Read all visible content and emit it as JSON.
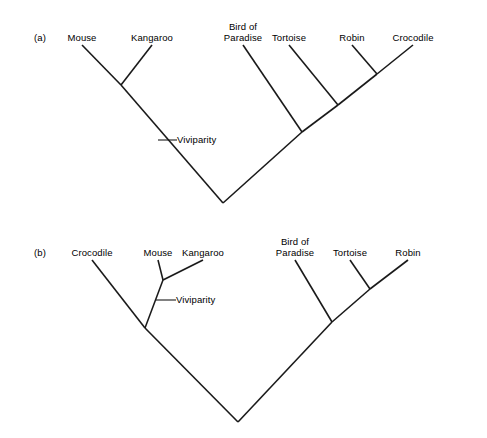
{
  "figure": {
    "width": 487,
    "height": 438,
    "background": "#ffffff",
    "line_color": "#1a1a1a",
    "text_color": "#000000"
  },
  "panels": [
    {
      "id": "a",
      "label": "(a)",
      "label_x": 34,
      "label_y": 33,
      "tips": [
        {
          "name": "mouse",
          "label": "Mouse",
          "x": 82,
          "y": 33,
          "line_x": 82,
          "line_y": 45
        },
        {
          "name": "kangaroo",
          "label": "Kangaroo",
          "x": 152,
          "y": 33,
          "line_x": 152,
          "line_y": 45
        },
        {
          "name": "bird-of-paradise",
          "label": "Bird of\nParadise",
          "x": 243,
          "y": 22,
          "line_x": 243,
          "line_y": 45
        },
        {
          "name": "tortoise",
          "label": "Tortoise",
          "x": 289,
          "y": 33,
          "line_x": 289,
          "line_y": 45
        },
        {
          "name": "robin",
          "label": "Robin",
          "x": 352,
          "y": 33,
          "line_x": 352,
          "line_y": 45
        },
        {
          "name": "crocodile",
          "label": "Crocodile",
          "x": 413,
          "y": 33,
          "line_x": 413,
          "line_y": 45
        }
      ],
      "nodes": [
        {
          "name": "mouse-kangaroo-node",
          "x": 121,
          "y": 85
        },
        {
          "name": "robin-crocodile-node",
          "x": 377,
          "y": 74
        },
        {
          "name": "tortoise-node",
          "x": 338,
          "y": 105
        },
        {
          "name": "bird-node",
          "x": 302,
          "y": 132
        },
        {
          "name": "root-node",
          "x": 223,
          "y": 203
        }
      ],
      "branches": [
        {
          "name": "branch-mouse",
          "x1": 82,
          "y1": 45,
          "x2": 121,
          "y2": 85
        },
        {
          "name": "branch-kangaroo",
          "x1": 152,
          "y1": 45,
          "x2": 121,
          "y2": 85
        },
        {
          "name": "branch-mammal-stem",
          "x1": 121,
          "y1": 85,
          "x2": 223,
          "y2": 203
        },
        {
          "name": "branch-crocodile",
          "x1": 413,
          "y1": 45,
          "x2": 377,
          "y2": 74
        },
        {
          "name": "branch-robin",
          "x1": 352,
          "y1": 45,
          "x2": 377,
          "y2": 74
        },
        {
          "name": "branch-robin-croc-stem",
          "x1": 377,
          "y1": 74,
          "x2": 338,
          "y2": 105
        },
        {
          "name": "branch-tortoise",
          "x1": 289,
          "y1": 45,
          "x2": 338,
          "y2": 105
        },
        {
          "name": "branch-tortoise-stem",
          "x1": 338,
          "y1": 105,
          "x2": 302,
          "y2": 132
        },
        {
          "name": "branch-bird",
          "x1": 243,
          "y1": 45,
          "x2": 302,
          "y2": 132
        },
        {
          "name": "branch-reptile-stem",
          "x1": 302,
          "y1": 132,
          "x2": 223,
          "y2": 203
        }
      ],
      "trait": {
        "name": "viviparity",
        "label": "Viviparity",
        "tick_x1": 158,
        "tick_y1": 140,
        "tick_x2": 177,
        "tick_y2": 140,
        "label_x": 177,
        "label_y": 135
      }
    },
    {
      "id": "b",
      "label": "(b)",
      "label_x": 34,
      "label_y": 248,
      "tips": [
        {
          "name": "crocodile",
          "label": "Crocodile",
          "x": 92,
          "y": 248,
          "line_x": 92,
          "line_y": 260
        },
        {
          "name": "mouse",
          "label": "Mouse",
          "x": 158,
          "y": 248,
          "line_x": 158,
          "line_y": 260
        },
        {
          "name": "kangaroo",
          "label": "Kangaroo",
          "x": 203,
          "y": 248,
          "line_x": 203,
          "line_y": 260
        },
        {
          "name": "bird-of-paradise",
          "label": "Bird of\nParadise",
          "x": 295,
          "y": 237,
          "line_x": 295,
          "line_y": 260
        },
        {
          "name": "tortoise",
          "label": "Tortoise",
          "x": 350,
          "y": 248,
          "line_x": 350,
          "line_y": 260
        },
        {
          "name": "robin",
          "label": "Robin",
          "x": 408,
          "y": 248,
          "line_x": 408,
          "line_y": 260
        }
      ],
      "nodes": [
        {
          "name": "mouse-kangaroo-node",
          "x": 163,
          "y": 280
        },
        {
          "name": "crocodile-node",
          "x": 145,
          "y": 328
        },
        {
          "name": "tortoise-robin-node",
          "x": 370,
          "y": 289
        },
        {
          "name": "bird-node",
          "x": 332,
          "y": 322
        },
        {
          "name": "root-node",
          "x": 238,
          "y": 422
        }
      ],
      "branches": [
        {
          "name": "branch-mouse",
          "x1": 158,
          "y1": 260,
          "x2": 163,
          "y2": 280
        },
        {
          "name": "branch-kangaroo",
          "x1": 203,
          "y1": 260,
          "x2": 163,
          "y2": 280
        },
        {
          "name": "branch-mouse-kang-stem",
          "x1": 163,
          "y1": 280,
          "x2": 145,
          "y2": 328
        },
        {
          "name": "branch-crocodile",
          "x1": 92,
          "y1": 260,
          "x2": 145,
          "y2": 328
        },
        {
          "name": "branch-croc-clade-stem",
          "x1": 145,
          "y1": 328,
          "x2": 238,
          "y2": 422
        },
        {
          "name": "branch-robin",
          "x1": 408,
          "y1": 260,
          "x2": 370,
          "y2": 289
        },
        {
          "name": "branch-tortoise",
          "x1": 350,
          "y1": 260,
          "x2": 370,
          "y2": 289
        },
        {
          "name": "branch-tortoise-robin-stem",
          "x1": 370,
          "y1": 289,
          "x2": 332,
          "y2": 322
        },
        {
          "name": "branch-bird",
          "x1": 295,
          "y1": 260,
          "x2": 332,
          "y2": 322
        },
        {
          "name": "branch-bird-clade-stem",
          "x1": 332,
          "y1": 322,
          "x2": 238,
          "y2": 422
        }
      ],
      "trait": {
        "name": "viviparity",
        "label": "Viviparity",
        "tick_x1": 156,
        "tick_y1": 300,
        "tick_x2": 176,
        "tick_y2": 300,
        "label_x": 176,
        "label_y": 295
      }
    }
  ]
}
